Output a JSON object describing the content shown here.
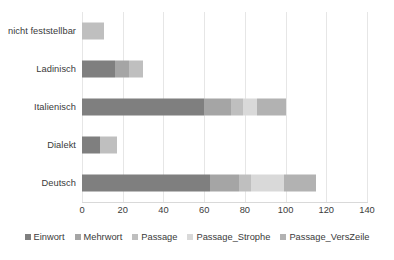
{
  "chart_data": {
    "type": "bar",
    "orientation": "horizontal",
    "stacked": true,
    "title": "",
    "xlabel": "",
    "ylabel": "",
    "xlim": [
      0,
      140
    ],
    "xticks": [
      0,
      20,
      40,
      60,
      80,
      100,
      120,
      140
    ],
    "xtick_labels": [
      "0",
      "20",
      "40",
      "60",
      "80",
      "100",
      "120",
      "140"
    ],
    "grid": "vertical",
    "legend_position": "bottom",
    "categories": [
      "nicht feststellbar",
      "Ladinisch",
      "Italienisch",
      "Dialekt",
      "Deutsch"
    ],
    "series": [
      {
        "name": "Einwort",
        "color": "#7f7f7f",
        "values": [
          0,
          16,
          60,
          9,
          63
        ]
      },
      {
        "name": "Mehrwort",
        "color": "#a5a5a5",
        "values": [
          0,
          7,
          13,
          0,
          14
        ]
      },
      {
        "name": "Passage",
        "color": "#bfbfbf",
        "values": [
          11,
          7,
          6,
          8,
          6
        ]
      },
      {
        "name": "Passage_Strophe",
        "color": "#d9d9d9",
        "values": [
          0,
          0,
          7,
          0,
          16
        ]
      },
      {
        "name": "Passage_VersZeile",
        "color": "#b2b2b2",
        "values": [
          0,
          0,
          14,
          0,
          16
        ]
      }
    ],
    "totals": [
      11,
      30,
      100,
      17,
      115
    ]
  },
  "legend": {
    "items": [
      {
        "label": "Einwort",
        "color": "#7f7f7f"
      },
      {
        "label": "Mehrwort",
        "color": "#a5a5a5"
      },
      {
        "label": "Passage",
        "color": "#bfbfbf"
      },
      {
        "label": "Passage_Strophe",
        "color": "#d9d9d9"
      },
      {
        "label": "Passage_VersZeile",
        "color": "#b2b2b2"
      }
    ]
  },
  "axis": {
    "grid_color": "#e6e6e6",
    "line_color": "#d9d9d9",
    "text_color": "#3a3a3a"
  }
}
